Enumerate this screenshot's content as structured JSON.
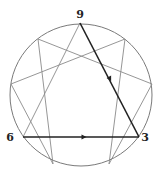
{
  "diagram": {
    "type": "enneagram",
    "width": 161,
    "height": 180,
    "circle": {
      "cx": 81,
      "cy": 95,
      "r": 71,
      "stroke": "#7a7a7a"
    },
    "labels": [
      {
        "text": "9",
        "x": 80,
        "y": 18
      },
      {
        "text": "6",
        "x": 10,
        "y": 141
      },
      {
        "text": "3",
        "x": 145,
        "y": 141
      }
    ],
    "points": {
      "9": [
        80,
        23
      ],
      "1": [
        125,
        39
      ],
      "2": [
        152,
        84
      ],
      "3": [
        139,
        137
      ],
      "4": [
        109,
        164
      ],
      "5": [
        53,
        164
      ],
      "6": [
        23,
        137
      ],
      "7": [
        11,
        84
      ],
      "8": [
        38,
        39
      ]
    },
    "thin_lines": [
      [
        "9",
        "6"
      ],
      [
        "1",
        "4"
      ],
      [
        "4",
        "2"
      ],
      [
        "2",
        "8"
      ],
      [
        "8",
        "5"
      ],
      [
        "5",
        "7"
      ],
      [
        "7",
        "1"
      ]
    ],
    "thick_lines": [
      {
        "from": "9",
        "to": "3",
        "arrow_at": [
          110,
          79
        ]
      },
      {
        "from": "6",
        "to": "3",
        "arrow_at": [
          84,
          137
        ]
      }
    ],
    "colors": {
      "thin": "#8a8a8a",
      "thick": "#222222",
      "label": "#222222"
    }
  }
}
